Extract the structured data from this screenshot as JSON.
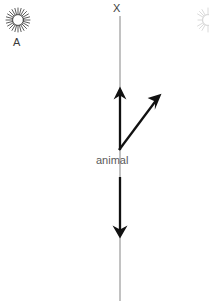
{
  "diagram": {
    "background_color": "#ffffff",
    "axis_color": "#b3b3b3",
    "arrow_color": "#111111",
    "icon_color": "#4a4a4a",
    "text_color": "#3b3b3b",
    "muted_text_color": "#5a5a5a"
  },
  "labels": {
    "axis_top": "X",
    "sun_label": "A",
    "center_label": "animal"
  },
  "icons": {
    "sun_left": "sun-icon",
    "sun_right_clipped": "sun-icon"
  },
  "axis": {
    "name": "vertical-axis",
    "x": 120,
    "y_top": 16,
    "y_bottom": 301
  },
  "arrows": [
    {
      "name": "arrow-up",
      "direction": "up",
      "x1": 120,
      "y1": 150,
      "x2": 120,
      "y2": 88
    },
    {
      "name": "arrow-diagonal-up-right",
      "direction": "up-right",
      "x1": 119,
      "y1": 150,
      "x2": 160,
      "y2": 95
    },
    {
      "name": "arrow-down",
      "direction": "down",
      "x1": 120,
      "y1": 177,
      "x2": 120,
      "y2": 237
    }
  ]
}
